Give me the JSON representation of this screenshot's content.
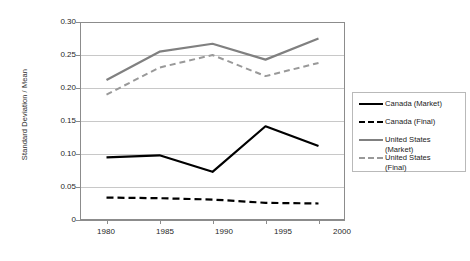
{
  "chart_data": {
    "type": "line",
    "title": "",
    "xlabel": "",
    "ylabel": "Standard Deviation / Mean",
    "x": [
      1980,
      1985,
      1990,
      1995,
      2000
    ],
    "categories": [
      "1980",
      "1985",
      "1990",
      "1995",
      "2000"
    ],
    "xlim": [
      1977.5,
      2002.5
    ],
    "ylim": [
      0,
      0.3
    ],
    "yticks": [
      0,
      0.05,
      0.1,
      0.15,
      0.2,
      0.25,
      0.3
    ],
    "ytick_labels": [
      "0",
      "0.05",
      "0.10",
      "0.15",
      "0.20",
      "0.25",
      "0.30"
    ],
    "xtick_labels": [
      "1980",
      "1985",
      "1990",
      "1995",
      "2000"
    ],
    "grid": "horizontal",
    "legend_position": "right",
    "series": [
      {
        "name": "Canada (Market)",
        "values": [
          0.095,
          0.098,
          0.073,
          0.142,
          0.112
        ],
        "color": "#000000",
        "style": "solid",
        "width": 2.2
      },
      {
        "name": "Canada (Final)",
        "values": [
          0.034,
          0.033,
          0.031,
          0.026,
          0.025
        ],
        "color": "#000000",
        "style": "dashed",
        "width": 2.2
      },
      {
        "name": "United States (Market)",
        "values": [
          0.212,
          0.255,
          0.267,
          0.243,
          0.275
        ],
        "color": "#808080",
        "style": "solid",
        "width": 2.2
      },
      {
        "name": "United States (Final)",
        "values": [
          0.19,
          0.231,
          0.25,
          0.218,
          0.238
        ],
        "color": "#999999",
        "style": "dashed",
        "width": 2.0
      }
    ]
  },
  "legend": {
    "items": [
      {
        "label": "Canada (Market)",
        "color": "#000000",
        "style": "solid"
      },
      {
        "label": "Canada (Final)",
        "color": "#000000",
        "style": "dashed"
      },
      {
        "label": "United States\n(Market)",
        "color": "#808080",
        "style": "solid"
      },
      {
        "label": "United States\n(Final)",
        "color": "#999999",
        "style": "dashed"
      }
    ]
  },
  "axes": {
    "y_title": "Standard Deviation / Mean",
    "y_labels": [
      "0.30",
      "0.25",
      "0.20",
      "0.15",
      "0.10",
      "0.05",
      "0"
    ],
    "x_labels": [
      "1980",
      "1985",
      "1990",
      "1995",
      "2000"
    ]
  },
  "colors": {
    "plot_border": "#8c8c8c",
    "gridline": "#c8c8c8",
    "canada": "#000000",
    "united_states": "#808080",
    "background": "#ffffff"
  }
}
